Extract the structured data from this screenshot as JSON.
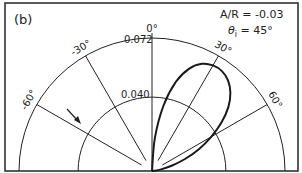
{
  "panel_label": "(b)",
  "annotations": {
    "ratio": "A/R = -0.03",
    "incidence": "θi = 45°",
    "incidence_symbol": "θ",
    "incidence_sub": "i",
    "incidence_value": " = 45°"
  },
  "radial_ticks": [
    {
      "value": 0.04,
      "label": "0.040"
    },
    {
      "value": 0.072,
      "label": "0.072"
    }
  ],
  "angle_ticks": [
    {
      "angle": -60,
      "label": "-60°"
    },
    {
      "angle": -30,
      "label": "-30°"
    },
    {
      "angle": 0,
      "label": "0°"
    },
    {
      "angle": 30,
      "label": "30°"
    },
    {
      "angle": 60,
      "label": "60°"
    }
  ],
  "arrow": {
    "meaning": "incident direction",
    "angle_deg": -45
  },
  "colors": {
    "line": "#222222",
    "curve": "#1a1a1a",
    "frame": "#333333"
  },
  "chart_data": {
    "type": "polar",
    "title": "(b)",
    "annotations": [
      "A/R = -0.03",
      "θi = 45°"
    ],
    "theta_range_deg": [
      -90,
      90
    ],
    "r_range": [
      0,
      0.072
    ],
    "r_ticks": [
      0.04,
      0.072
    ],
    "theta_ticks_deg": [
      -60,
      -30,
      0,
      30,
      60
    ],
    "grid": true,
    "series": [
      {
        "name": "scattered intensity lobe",
        "theta_deg": [
          0,
          5,
          10,
          15,
          20,
          25,
          30,
          35,
          40,
          45,
          50,
          55,
          60,
          65,
          70,
          75,
          80,
          85,
          90
        ],
        "r": [
          0.0,
          0.018,
          0.036,
          0.05,
          0.059,
          0.064,
          0.066,
          0.066,
          0.064,
          0.06,
          0.054,
          0.046,
          0.037,
          0.028,
          0.019,
          0.011,
          0.005,
          0.001,
          0.0
        ]
      }
    ],
    "peak": {
      "theta_deg": 33,
      "r": 0.066
    }
  }
}
